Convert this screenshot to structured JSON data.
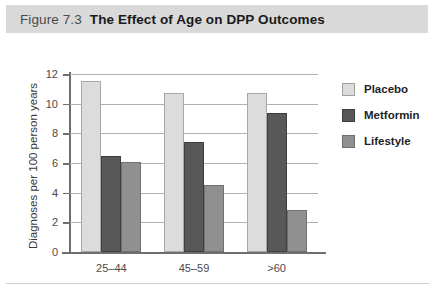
{
  "figure": {
    "number": "Figure 7.3",
    "title": "The Effect of Age on DPP Outcomes"
  },
  "colors": {
    "placebo": "#dcdcdc",
    "metformin": "#585858",
    "lifestyle": "#909090",
    "title_band": "#d9d9d9",
    "axis": "#6e6e6e",
    "gridline": "#b0b0b0"
  },
  "chart_data": {
    "type": "bar",
    "title": "The Effect of Age on DPP Outcomes",
    "xlabel": "",
    "ylabel": "Diagnoses per 100 person years",
    "categories": [
      "25–44",
      "45–59",
      ">60"
    ],
    "series": [
      {
        "name": "Placebo",
        "values": [
          11.5,
          10.7,
          10.7
        ]
      },
      {
        "name": "Metformin",
        "values": [
          6.5,
          7.4,
          9.4
        ]
      },
      {
        "name": "Lifestyle",
        "values": [
          6.1,
          4.55,
          2.85
        ]
      }
    ],
    "ylim": [
      0,
      12
    ],
    "yticks": [
      0,
      2,
      4,
      6,
      8,
      10,
      12
    ],
    "ytick_labels": [
      "0",
      "2",
      "4",
      "6",
      "8",
      "10",
      "12"
    ],
    "grid": true,
    "grid_axis": "y",
    "legend_position": "right"
  }
}
